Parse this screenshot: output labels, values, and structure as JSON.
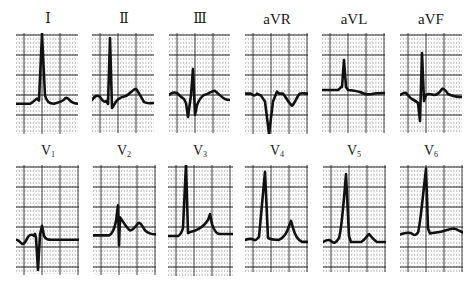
{
  "figure": {
    "colors": {
      "trace": "#111111",
      "grid_major": "#2a2a2a",
      "grid_minor": "#777777",
      "paper": "#ffffff"
    },
    "rows": [
      {
        "leads": [
          {
            "id": "I",
            "label": "Ⅰ",
            "sub": "",
            "x": 16,
            "y": 33,
            "w": 62,
            "h": 101,
            "baseline": 0.7,
            "path": "M0,0 L14,0 C17,-1 19,-4 21,-5 L23,-3 L26,-70 L29,-8 C31,-2 33,0 38,0 C42,-1 46,-2 48,-4 C50,-7 52,-6 54,-3 C56,-1 58,0 62,0"
          },
          {
            "id": "II",
            "label": "Ⅱ",
            "sub": "",
            "x": 92,
            "y": 33,
            "w": 62,
            "h": 100,
            "baseline": 0.67,
            "path": "M0,0 C2,-3 5,-6 8,-3 C10,0 12,3 14,1 L16,4 L18,-62 L20,8 L22,5 C24,0 28,-3 34,-4 C38,-6 42,-12 44,-11 C46,-9 49,-3 52,2 C55,4 58,3 62,3"
          },
          {
            "id": "III",
            "label": "Ⅲ",
            "sub": "",
            "x": 169,
            "y": 33,
            "w": 61,
            "h": 100,
            "baseline": 0.62,
            "path": "M0,0 C2,-2 5,-3 8,-2 C10,0 12,2 15,4 L17,8 L19,22 L22,0 L24,-26 L26,20 L28,10 C30,5 32,2 35,0 C40,-1 44,-5 46,-4 C49,-2 53,3 56,4 C58,5 60,5 61,5"
          }
        ]
      },
      {
        "leads": [
          {
            "id": "aVR",
            "label": "aVR",
            "sub": "",
            "x": 245,
            "y": 33,
            "w": 63,
            "h": 101,
            "baseline": 0.6,
            "path": "M0,0 L6,0 C8,2 10,3 12,0 L16,2 L20,8 L24,40 L28,8 L32,-2 L34,0 L38,0 C40,2 44,10 47,12 C50,10 52,2 55,0 C57,-1 60,0 63,0"
          },
          {
            "id": "aVL",
            "label": "aVL",
            "sub": "",
            "x": 322,
            "y": 33,
            "w": 63,
            "h": 100,
            "baseline": 0.57,
            "path": "M0,0 L16,0 C18,-1 19,-4 20,-3 L22,-30 L24,-3 L26,0 C30,0 34,1 38,2 C42,4 46,5 50,4 C54,3 58,3 63,3"
          },
          {
            "id": "aVF",
            "label": "aVF",
            "sub": "",
            "x": 400,
            "y": 33,
            "w": 62,
            "h": 100,
            "baseline": 0.62,
            "path": "M0,0 C2,-1 4,-3 6,-2 C8,0 10,3 12,4 C14,5 16,6 18,8 L20,26 L22,-42 L24,6 L26,0 C28,-2 30,-1 34,0 C38,0 40,-3 42,-6 C44,-7 46,-4 48,-1 C52,1 57,2 62,2"
          }
        ]
      },
      {
        "leads": [
          {
            "id": "V1",
            "label": "V",
            "sub": "1",
            "x": 16,
            "y": 165,
            "w": 63,
            "h": 110,
            "baseline": 0.68,
            "path": "M0,0 C2,0 4,2 6,4 C8,5 10,1 12,-3 C14,-5 16,-6 18,-4 L19,-6 L20,-2 L22,30 L24,-5 L26,-14 L28,-4 C30,0 32,0 36,0 L63,0"
          },
          {
            "id": "V2",
            "label": "V",
            "sub": "2",
            "x": 93,
            "y": 165,
            "w": 63,
            "h": 110,
            "baseline": 0.64,
            "path": "M0,0 L16,0 C19,-1 21,-5 23,-14 L25,-30 L26,10 L27,-18 C30,-14 34,-7 37,-5 C40,-5 42,-8 45,-12 C47,-14 49,-10 52,-5 C55,-2 58,-1 63,-1"
          },
          {
            "id": "V3",
            "label": "V",
            "sub": "3",
            "x": 168,
            "y": 165,
            "w": 65,
            "h": 111,
            "baseline": 0.64,
            "path": "M0,0 L10,0 C12,-1 14,-4 15,-8 L18,-72 L20,-3 L22,-4 L26,-5 C32,-7 36,-10 40,-16 L42,-22 L44,-12 C46,-6 48,-2 52,-2 L65,-2"
          }
        ]
      },
      {
        "leads": [
          {
            "id": "V4",
            "label": "V",
            "sub": "4",
            "x": 245,
            "y": 165,
            "w": 63,
            "h": 107,
            "baseline": 0.7,
            "path": "M0,0 C3,-1 6,-2 9,0 C11,1 12,-1 14,-3 L20,-68 L23,-2 C26,0 30,0 34,0 C38,-2 42,-6 44,-14 L46,-19 L48,-12 C50,-4 53,0 57,2 L63,2"
          },
          {
            "id": "V5",
            "label": "V",
            "sub": "5",
            "x": 323,
            "y": 165,
            "w": 63,
            "h": 107,
            "baseline": 0.72,
            "path": "M0,0 C3,-2 6,-3 8,-1 C11,2 13,1 16,-4 C18,-10 20,-30 23,-68 L26,-6 L28,0 L38,0 C42,-2 44,-6 46,-8 C48,-6 51,-2 54,0 L63,0"
          },
          {
            "id": "V6",
            "label": "V",
            "sub": "6",
            "x": 400,
            "y": 165,
            "w": 63,
            "h": 107,
            "baseline": 0.65,
            "path": "M0,0 C4,-1 8,-3 12,-1 C14,1 16,1 18,-2 C20,-8 22,-30 26,-66 L28,-6 L30,-1 C34,-2 38,-2 42,-3 C46,-4 50,-6 54,-6 C58,-5 60,-3 63,-2"
          }
        ]
      }
    ],
    "label_positions": {
      "I": [
        8,
        11
      ],
      "II": [
        84,
        11
      ],
      "III": [
        160,
        11
      ],
      "aVR": [
        237,
        11
      ],
      "aVL": [
        314,
        11
      ],
      "aVF": [
        391,
        11
      ],
      "V1": [
        8,
        143
      ],
      "V2": [
        84,
        143
      ],
      "V3": [
        160,
        143
      ],
      "V4": [
        237,
        143
      ],
      "V5": [
        314,
        143
      ],
      "V6": [
        391,
        143
      ]
    }
  }
}
